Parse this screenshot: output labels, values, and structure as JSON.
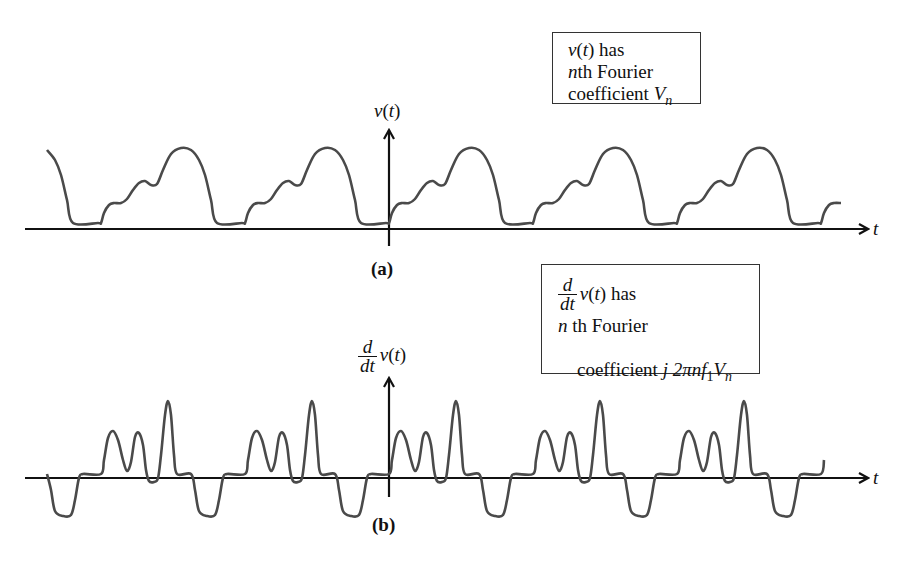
{
  "panel_a": {
    "caption": "(a)",
    "y_axis_label": {
      "fn": "v",
      "open": "(",
      "var": "t",
      "close": ")"
    },
    "x_axis_label": "t",
    "info_box": {
      "line1_fn": "v",
      "line1_open": "(",
      "line1_var": "t",
      "line1_close": ") has",
      "line2_n": "n",
      "line2_rest": "th Fourier",
      "line3_text": "coefficient ",
      "line3_V": "V",
      "line3_sub": "n"
    }
  },
  "panel_b": {
    "caption": "(b)",
    "y_axis_label": {
      "num": "d",
      "den": "dt",
      "fn": "v",
      "open": "(",
      "var": "t",
      "close": ")"
    },
    "x_axis_label": "t",
    "info_box": {
      "line1_num": "d",
      "line1_den": "dt",
      "line1_fn": "v",
      "line1_open": "(",
      "line1_var": "t",
      "line1_close": ") has",
      "line2_n": "n",
      "line2_rest": " th Fourier",
      "line3_text": "coefficient ",
      "line3_expr": "j 2πnf",
      "line3_sub1": "1",
      "line3_V": "V",
      "line3_sub2": "n"
    }
  },
  "colors": {
    "waveform": "#4a4a4a",
    "axis": "#111111"
  },
  "waveform_a": {
    "period_px": 144,
    "start_x": 389,
    "baseline_y": 223,
    "shape": [
      [
        0,
        223
      ],
      [
        3,
        213
      ],
      [
        8,
        205
      ],
      [
        13,
        203
      ],
      [
        20,
        203
      ],
      [
        26,
        199
      ],
      [
        32,
        190
      ],
      [
        38,
        183
      ],
      [
        44,
        181
      ],
      [
        50,
        185
      ],
      [
        56,
        184
      ],
      [
        62,
        170
      ],
      [
        70,
        154
      ],
      [
        80,
        148
      ],
      [
        90,
        150
      ],
      [
        98,
        160
      ],
      [
        104,
        175
      ],
      [
        110,
        200
      ],
      [
        116,
        223
      ],
      [
        141,
        223
      ],
      [
        144,
        223
      ]
    ]
  },
  "waveform_b": {
    "period_px": 144,
    "start_x": 389,
    "baseline_y": 474,
    "shape": [
      [
        0,
        474
      ],
      [
        3,
        460
      ],
      [
        7,
        438
      ],
      [
        12,
        431
      ],
      [
        17,
        440
      ],
      [
        22,
        460
      ],
      [
        26,
        471
      ],
      [
        30,
        462
      ],
      [
        34,
        437
      ],
      [
        38,
        433
      ],
      [
        42,
        445
      ],
      [
        45,
        470
      ],
      [
        48,
        481
      ],
      [
        53,
        482
      ],
      [
        57,
        478
      ],
      [
        60,
        455
      ],
      [
        64,
        415
      ],
      [
        67,
        401
      ],
      [
        70,
        415
      ],
      [
        73,
        455
      ],
      [
        76,
        474
      ],
      [
        90,
        474
      ],
      [
        94,
        490
      ],
      [
        98,
        511
      ],
      [
        106,
        516
      ],
      [
        114,
        515
      ],
      [
        118,
        500
      ],
      [
        122,
        478
      ],
      [
        126,
        474
      ],
      [
        144,
        474
      ]
    ]
  }
}
